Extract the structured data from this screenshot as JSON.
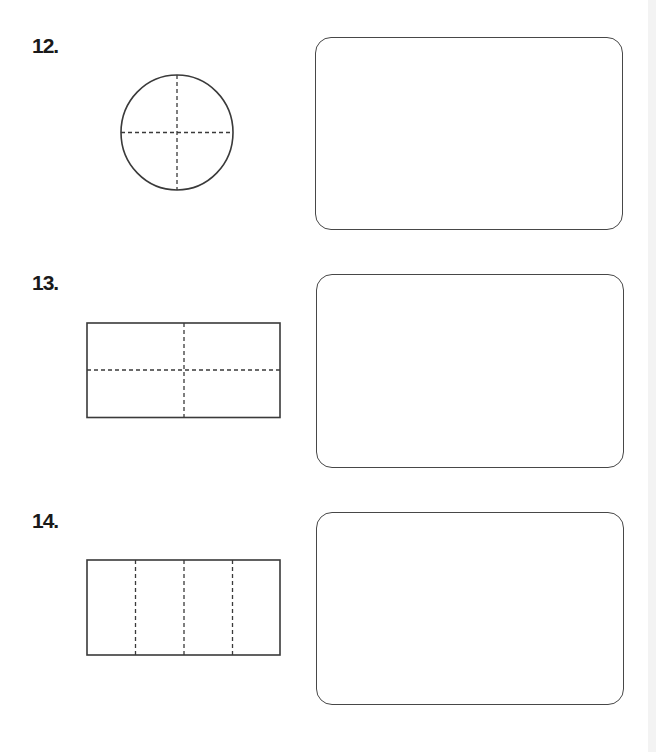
{
  "worksheet": {
    "colors": {
      "outline": "#3a3a3a",
      "dash": "#3a3a3a",
      "box_border": "#474747",
      "label": "#1a1a1a"
    },
    "questions": [
      {
        "number": "12.",
        "shape": "circle",
        "divisions": "4 equal parts (vertical + horizontal dashed lines)",
        "answer_box": ""
      },
      {
        "number": "13.",
        "shape": "rectangle",
        "divisions": "4 equal parts (vertical + horizontal dashed lines)",
        "answer_box": ""
      },
      {
        "number": "14.",
        "shape": "rectangle",
        "divisions": "4 equal parts (3 vertical dashed lines)",
        "answer_box": ""
      }
    ]
  }
}
